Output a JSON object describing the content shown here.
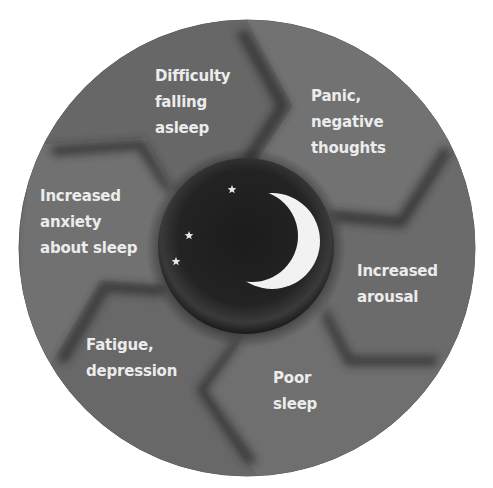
{
  "diagram": {
    "type": "cycle",
    "center": {
      "icon": "moon-and-stars-icon",
      "description": "crescent moon with three stars"
    },
    "segments": [
      {
        "id": "difficulty",
        "lines": [
          "Difficulty",
          "falling",
          "asleep"
        ]
      },
      {
        "id": "panic",
        "lines": [
          "Panic,",
          "negative",
          "thoughts"
        ]
      },
      {
        "id": "arousal",
        "lines": [
          "Increased",
          "arousal"
        ]
      },
      {
        "id": "poor-sleep",
        "lines": [
          "Poor",
          "sleep"
        ]
      },
      {
        "id": "fatigue",
        "lines": [
          "Fatigue,",
          "depression"
        ]
      },
      {
        "id": "anxiety",
        "lines": [
          "Increased",
          "anxiety",
          "about sleep"
        ]
      }
    ],
    "colors": {
      "segment": "#6e6e6e",
      "segment_shadow": "#3c3c3c",
      "center": "#1e1e1e",
      "moon": "#f2f2f2",
      "text": "#ececec",
      "background": "#ffffff"
    }
  }
}
